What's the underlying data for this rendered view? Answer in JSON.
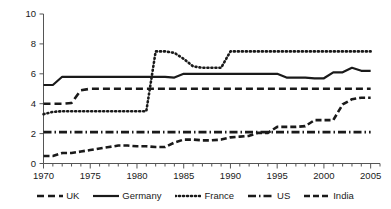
{
  "chart_data": {
    "type": "line",
    "title": "",
    "xlabel": "",
    "ylabel": "",
    "xlim": [
      1970,
      2006
    ],
    "ylim": [
      0,
      10
    ],
    "grid": false,
    "legend_position": "bottom",
    "x_ticks_major": [
      "1970",
      "1975",
      "1980",
      "1985",
      "1990",
      "1995",
      "2000",
      "2005"
    ],
    "x_ticks_major_values": [
      1970,
      1975,
      1980,
      1985,
      1990,
      1995,
      2000,
      2005
    ],
    "x_tick_minor_step": 1,
    "y_ticks": [
      "0",
      "2",
      "4",
      "6",
      "8",
      "10"
    ],
    "y_tick_values": [
      0,
      2,
      4,
      6,
      8,
      10
    ],
    "x": [
      1970,
      1971,
      1972,
      1973,
      1974,
      1975,
      1976,
      1977,
      1978,
      1979,
      1980,
      1981,
      1982,
      1983,
      1984,
      1985,
      1986,
      1987,
      1988,
      1989,
      1990,
      1991,
      1992,
      1993,
      1994,
      1995,
      1996,
      1997,
      1998,
      1999,
      2000,
      2001,
      2002,
      2003,
      2004,
      2005
    ],
    "series": [
      {
        "name": "UK",
        "style": "dashed",
        "color": "#1a1a1a",
        "width": 2.6,
        "dash": "7,4",
        "values": [
          4.0,
          4.0,
          4.0,
          4.05,
          4.9,
          5.0,
          5.0,
          5.0,
          5.0,
          5.0,
          5.0,
          5.0,
          5.0,
          5.0,
          5.0,
          5.0,
          5.0,
          5.0,
          5.0,
          5.0,
          5.0,
          5.0,
          5.0,
          5.0,
          5.0,
          5.0,
          5.0,
          5.0,
          5.0,
          5.0,
          5.0,
          5.0,
          5.0,
          5.0,
          5.0,
          5.0
        ]
      },
      {
        "name": "Germany",
        "style": "solid",
        "color": "#1a1a1a",
        "width": 2.2,
        "dash": "none",
        "values": [
          5.25,
          5.25,
          5.8,
          5.8,
          5.8,
          5.8,
          5.8,
          5.8,
          5.8,
          5.8,
          5.8,
          5.8,
          5.8,
          5.8,
          5.75,
          6.0,
          6.0,
          6.0,
          6.0,
          6.0,
          6.0,
          6.0,
          6.0,
          6.0,
          6.0,
          6.0,
          5.75,
          5.75,
          5.75,
          5.7,
          5.7,
          6.1,
          6.1,
          6.4,
          6.2,
          6.2
        ]
      },
      {
        "name": "France",
        "style": "dotted",
        "color": "#1a1a1a",
        "width": 2.6,
        "dash": "1,3",
        "values": [
          3.3,
          3.45,
          3.5,
          3.5,
          3.5,
          3.5,
          3.5,
          3.5,
          3.5,
          3.5,
          3.5,
          3.5,
          7.5,
          7.5,
          7.4,
          7.0,
          6.5,
          6.4,
          6.4,
          6.4,
          7.5,
          7.5,
          7.5,
          7.5,
          7.5,
          7.5,
          7.5,
          7.5,
          7.5,
          7.5,
          7.5,
          7.5,
          7.5,
          7.5,
          7.5,
          7.5
        ]
      },
      {
        "name": "US",
        "style": "dash-dot",
        "color": "#1a1a1a",
        "width": 2.6,
        "dash": "8,3,1.5,3",
        "values": [
          2.1,
          2.1,
          2.1,
          2.1,
          2.1,
          2.1,
          2.1,
          2.1,
          2.1,
          2.1,
          2.1,
          2.1,
          2.1,
          2.1,
          2.1,
          2.1,
          2.1,
          2.1,
          2.1,
          2.1,
          2.1,
          2.1,
          2.1,
          2.1,
          2.1,
          2.1,
          2.1,
          2.1,
          2.1,
          2.1,
          2.1,
          2.1,
          2.1,
          2.1,
          2.1,
          2.1
        ]
      },
      {
        "name": "India",
        "style": "dashed",
        "color": "#1a1a1a",
        "width": 2.6,
        "dash": "6,3",
        "values": [
          0.5,
          0.5,
          0.7,
          0.7,
          0.8,
          0.9,
          1.0,
          1.1,
          1.2,
          1.2,
          1.15,
          1.15,
          1.1,
          1.1,
          1.4,
          1.6,
          1.6,
          1.55,
          1.55,
          1.6,
          1.75,
          1.8,
          1.85,
          2.05,
          2.05,
          2.45,
          2.45,
          2.45,
          2.5,
          2.9,
          2.9,
          2.9,
          3.95,
          4.3,
          4.4,
          4.4
        ]
      }
    ]
  },
  "legend": {
    "items": [
      {
        "label": "UK",
        "swatch": "dashed-line-swatch"
      },
      {
        "label": "Germany",
        "swatch": "solid-line-swatch"
      },
      {
        "label": "France",
        "swatch": "dotted-line-swatch"
      },
      {
        "label": "US",
        "swatch": "dash-dot-line-swatch"
      },
      {
        "label": "India",
        "swatch": "dashed-line-swatch"
      }
    ]
  },
  "axis": {
    "y_labels": [
      "10",
      "8",
      "6",
      "4",
      "2",
      "0"
    ],
    "x_labels": [
      "1970",
      "1975",
      "1980",
      "1985",
      "1990",
      "1995",
      "2000",
      "2005"
    ]
  }
}
